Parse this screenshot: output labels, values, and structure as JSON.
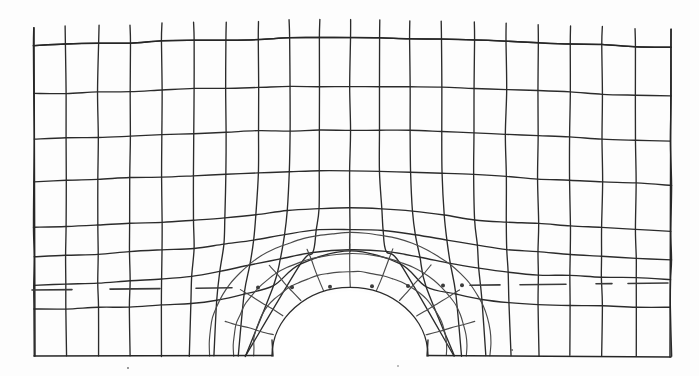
{
  "figure": {
    "caption": "",
    "background_color": "#fdfdfd",
    "line_color": "#2b2b2b",
    "boundary_color": "#262626",
    "centerline_color": "#3a3a3a"
  },
  "canvas": {
    "width": 699,
    "height": 376
  },
  "chart_data": {
    "type": "line",
    "xlabel": "",
    "ylabel": "",
    "grid": true,
    "legend": "none",
    "domain": {
      "x_left": 34,
      "x_right": 671,
      "y_top": 30,
      "y_bottom": 356,
      "top_boundary_y_left": 48,
      "top_boundary_y_center": 37,
      "top_boundary_y_right": 50
    },
    "hole": {
      "shape": "semicircle",
      "center_x": 350,
      "center_y": 356,
      "radius": 78,
      "left_x": 272,
      "right_x": 428,
      "crown_y": 278
    },
    "centerline": {
      "style": "dash-dot",
      "y_left": 290,
      "y_right": 283,
      "x_start": 32,
      "x_end": 671,
      "note": "horizontal axis of symmetry through the crown of the opening"
    },
    "mesh": {
      "vertical_lines": 21,
      "horizontal_lines": 8,
      "column_x": [
        34,
        66,
        98,
        130,
        162,
        194,
        226,
        258,
        290,
        320,
        350,
        380,
        410,
        442,
        474,
        506,
        538,
        570,
        602,
        636,
        671
      ],
      "row_y_left": [
        48,
        97,
        143,
        186,
        232,
        262,
        290,
        312,
        356
      ],
      "row_y_right": [
        50,
        99,
        145,
        189,
        236,
        265,
        283,
        310,
        356
      ],
      "row_bulge": [
        11,
        12,
        14,
        16,
        18,
        20,
        16,
        10,
        0
      ],
      "stub_overshoot_top": 18,
      "style": "hand-drawn scanned lithograph, thin dark grey strokes on off-white paper"
    },
    "radial_rings": [
      78,
      96,
      116,
      140
    ],
    "radial_spokes_deg": [
      0,
      18,
      36,
      54,
      72,
      90,
      108,
      126,
      144,
      162,
      180
    ]
  },
  "specks": [
    {
      "x": 512,
      "y": 350,
      "r": 1.1
    },
    {
      "x": 128,
      "y": 368,
      "r": 0.9
    },
    {
      "x": 398,
      "y": 366,
      "r": 0.8
    }
  ]
}
